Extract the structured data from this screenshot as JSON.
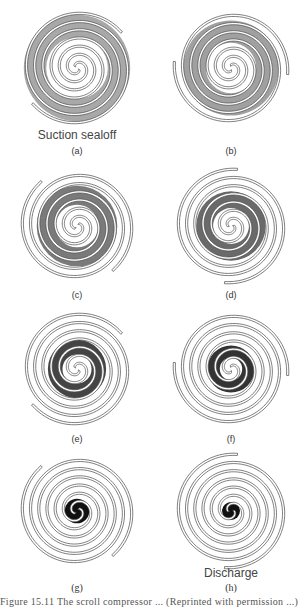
{
  "figure": {
    "caption": "Figure 15.11 The scroll compressor ... (Reprinted with permission ...)",
    "colors": {
      "stroke": "#4a4a4a",
      "pocket_light": "#a8a8a8",
      "pocket_mid": "#6e6e6e",
      "pocket_dark": "#1a1a1a"
    },
    "panels": [
      {
        "id": "a",
        "letter": "(a)",
        "annotation": "Suction sealoff",
        "cx": 76,
        "cy": 67,
        "rotation": 0,
        "pocket_shade": "#a8a8a8",
        "pocket_inner": 0.55,
        "pocket_outer": 0.95
      },
      {
        "id": "b",
        "letter": "(b)",
        "annotation": "",
        "cx": 230,
        "cy": 67,
        "rotation": 45,
        "pocket_shade": "#a0a0a0",
        "pocket_inner": 0.45,
        "pocket_outer": 0.85
      },
      {
        "id": "c",
        "letter": "(c)",
        "annotation": "",
        "cx": 76,
        "cy": 225,
        "rotation": 90,
        "pocket_shade": "#7a7a7a",
        "pocket_inner": 0.38,
        "pocket_outer": 0.72
      },
      {
        "id": "d",
        "letter": "(d)",
        "annotation": "",
        "cx": 230,
        "cy": 225,
        "rotation": 135,
        "pocket_shade": "#6a6a6a",
        "pocket_inner": 0.32,
        "pocket_outer": 0.62
      },
      {
        "id": "e",
        "letter": "(e)",
        "annotation": "",
        "cx": 76,
        "cy": 368,
        "rotation": 180,
        "pocket_shade": "#444444",
        "pocket_inner": 0.26,
        "pocket_outer": 0.52
      },
      {
        "id": "f",
        "letter": "(f)",
        "annotation": "",
        "cx": 230,
        "cy": 368,
        "rotation": 225,
        "pocket_shade": "#333333",
        "pocket_inner": 0.2,
        "pocket_outer": 0.42
      },
      {
        "id": "g",
        "letter": "(g)",
        "annotation": "",
        "cx": 76,
        "cy": 510,
        "rotation": 270,
        "pocket_shade": "#111111",
        "pocket_inner": 0.0,
        "pocket_outer": 0.22
      },
      {
        "id": "h",
        "letter": "(h)",
        "annotation": "Discharge",
        "cx": 230,
        "cy": 510,
        "rotation": 315,
        "pocket_shade": "#111111",
        "pocket_inner": 0.0,
        "pocket_outer": 0.16
      }
    ],
    "labels": {
      "a": {
        "letter": "(a)",
        "annotation": "Suction sealoff"
      },
      "b": {
        "letter": "(b)"
      },
      "c": {
        "letter": "(c)"
      },
      "d": {
        "letter": "(d)"
      },
      "e": {
        "letter": "(e)"
      },
      "f": {
        "letter": "(f)"
      },
      "g": {
        "letter": "(g)"
      },
      "h": {
        "letter": "(h)",
        "annotation": "Discharge"
      }
    }
  }
}
